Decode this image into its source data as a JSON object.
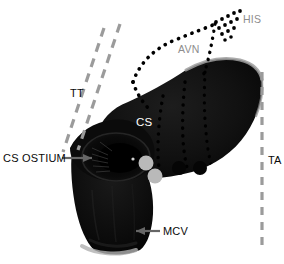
{
  "figure": {
    "kind": "anatomical-specimen-photograph",
    "background_color": "#ffffff",
    "tissue_color": "#0c0c0c",
    "tissue_highlight_color": "#9a9a9a",
    "width": 284,
    "height": 264
  },
  "labels": {
    "tt": "TT",
    "ta": "TA",
    "cs": "CS",
    "his": "HIS",
    "avn": "AVN",
    "cs_ostium": "CS OSTIUM",
    "mcv": "MCV"
  },
  "label_colors": {
    "dark": "#0a0a0a",
    "white": "#ffffff",
    "gray": "#8d8d8d"
  },
  "annotations": [
    {
      "name": "tt",
      "text": "TT",
      "style": "dark",
      "x": 70,
      "y": 88,
      "marker": "dashed-gray-lines"
    },
    {
      "name": "ta",
      "text": "TA",
      "style": "dark",
      "x": 268,
      "y": 155,
      "marker": "dashed-gray-vertical-line"
    },
    {
      "name": "cs",
      "text": "CS",
      "style": "white",
      "x": 136,
      "y": 117,
      "marker": "none"
    },
    {
      "name": "his",
      "text": "HIS",
      "style": "gray",
      "x": 243,
      "y": 14,
      "marker": "dotted-cluster"
    },
    {
      "name": "avn",
      "text": "AVN",
      "style": "gray",
      "x": 178,
      "y": 44,
      "marker": "dotted-curve"
    },
    {
      "name": "cs-ostium",
      "text": "CS OSTIUM",
      "style": "dark",
      "x": 3,
      "y": 153,
      "marker": "arrow-right"
    },
    {
      "name": "mcv",
      "text": "MCV",
      "style": "dark",
      "x": 163,
      "y": 226,
      "marker": "arrow-left"
    }
  ],
  "guide_lines": {
    "tt_dashed": {
      "color": "#9b9b9b",
      "dash": "9 7",
      "width": 3.2,
      "segments": [
        {
          "x1": 104,
          "y1": 28,
          "x2": 63,
          "y2": 152
        },
        {
          "x1": 120,
          "y1": 24,
          "x2": 78,
          "y2": 150
        }
      ]
    },
    "ta_dashed": {
      "color": "#9b9b9b",
      "dash": "8 7",
      "width": 3.2,
      "segments": [
        {
          "x1": 262,
          "y1": 72,
          "x2": 262,
          "y2": 246
        }
      ]
    }
  },
  "conduction_paths": {
    "avn_curve": {
      "color": "#000000",
      "style": "dotted",
      "dot_size": 2.6,
      "description": "dotted arc sweeping from lower-left up and right toward the His bundle"
    },
    "his_cluster": {
      "color": "#000000",
      "style": "dotted-wedge",
      "description": "triangular cluster of dots at the His bundle"
    },
    "septal_tracks": {
      "color": "#000000",
      "style": "dotted",
      "count": 3,
      "description": "three dotted tracks descending through the atrial septal tissue"
    }
  },
  "markers": [
    {
      "name": "ablation-marker-1",
      "shape": "circle",
      "fill": "#b9b9b9",
      "cx": 146,
      "cy": 163,
      "r": 7.5
    },
    {
      "name": "ablation-marker-2",
      "shape": "circle",
      "fill": "#b9b9b9",
      "cx": 155,
      "cy": 176,
      "r": 7.5
    },
    {
      "name": "ablation-marker-3",
      "shape": "circle",
      "fill": "#050505",
      "cx": 179,
      "cy": 168,
      "r": 7.0
    },
    {
      "name": "ablation-marker-4",
      "shape": "circle",
      "fill": "#050505",
      "cx": 200,
      "cy": 168,
      "r": 7.0
    }
  ]
}
